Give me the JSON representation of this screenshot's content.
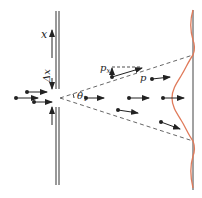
{
  "labels": {
    "position_axis": "x",
    "slit_width": "Δx",
    "angle": "θ",
    "angle_sub": "1",
    "transverse_momentum": "p",
    "transverse_momentum_sub": "x",
    "momentum": "p"
  },
  "colors": {
    "ink": "#222222",
    "wall": "#555555",
    "intensity_curve": "#e07a5a",
    "dashed": "#555555"
  }
}
